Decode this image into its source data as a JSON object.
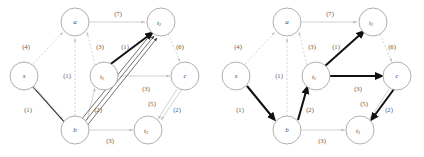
{
  "figure": {
    "type": "diagram",
    "kind": "directed-graph-pair",
    "panels": [
      {
        "id": "left",
        "nodes": [
          {
            "id": "a",
            "label": "a",
            "sub": "",
            "cx": 75,
            "cy": 22,
            "r": 14
          },
          {
            "id": "t2",
            "label": "t",
            "sub": "2",
            "cx": 161,
            "cy": 22,
            "r": 14
          },
          {
            "id": "s",
            "label": "s",
            "sub": "",
            "cx": 24,
            "cy": 76,
            "r": 14
          },
          {
            "id": "t1",
            "label": "t",
            "sub": "1",
            "cx": 104,
            "cy": 76,
            "r": 14
          },
          {
            "id": "c",
            "label": "c",
            "sub": "",
            "cx": 185,
            "cy": 76,
            "r": 14
          },
          {
            "id": "b",
            "label": "b",
            "sub": "",
            "cx": 75,
            "cy": 130,
            "r": 14
          },
          {
            "id": "t3",
            "label": "t",
            "sub": "3",
            "cx": 148,
            "cy": 130,
            "r": 14
          }
        ],
        "edges": [
          {
            "from": "s",
            "to": "a",
            "cost": "(4)",
            "style": "dash",
            "lx": 26,
            "ly": 47
          },
          {
            "from": "b",
            "to": "a",
            "cost": "(1)",
            "style": "dash",
            "lx": 67,
            "ly": 76
          },
          {
            "from": "t1",
            "to": "a",
            "cost": "(3)",
            "style": "dash",
            "lx": 100,
            "ly": 47
          },
          {
            "from": "a",
            "to": "t2",
            "cost": "(7)",
            "style": "light",
            "lx": 118,
            "ly": 14
          },
          {
            "from": "t1",
            "to": "t2",
            "cost": "(1)",
            "style": "bold",
            "lx": 125,
            "ly": 47
          },
          {
            "from": "t2",
            "to": "c",
            "cost": "(6)",
            "style": "dash",
            "lx": 180,
            "ly": 47
          },
          {
            "from": "t1",
            "to": "c",
            "cost": "(3)",
            "style": "light",
            "lx": 146,
            "ly": 89
          },
          {
            "from": "s",
            "to": "b",
            "cost": "(1)",
            "style": "light",
            "lx": 28,
            "ly": 110
          },
          {
            "from": "b",
            "to": "t1",
            "cost": "(2)",
            "style": "light",
            "lx": 98,
            "ly": 110
          },
          {
            "from": "b",
            "to": "t3",
            "cost": "(3)",
            "style": "light",
            "lx": 110,
            "ly": 141
          },
          {
            "from": "c",
            "to": "t3",
            "cost": "(5)",
            "style": "light",
            "lx": 152,
            "ly": 104
          },
          {
            "from": "c",
            "to": "t3",
            "cost": "(2)",
            "style": "light",
            "lx": 177,
            "ly": 110
          }
        ],
        "highlighted_paths": "s->b->t1->t2 (overlaid multi-line path)"
      },
      {
        "id": "right",
        "nodes": [
          {
            "id": "a",
            "label": "a",
            "sub": "",
            "cx": 75,
            "cy": 22,
            "r": 14
          },
          {
            "id": "t2",
            "label": "t",
            "sub": "2",
            "cx": 161,
            "cy": 22,
            "r": 14
          },
          {
            "id": "s",
            "label": "s",
            "sub": "",
            "cx": 24,
            "cy": 76,
            "r": 14
          },
          {
            "id": "t1",
            "label": "t",
            "sub": "1",
            "cx": 104,
            "cy": 76,
            "r": 14
          },
          {
            "id": "c",
            "label": "c",
            "sub": "",
            "cx": 185,
            "cy": 76,
            "r": 14
          },
          {
            "id": "b",
            "label": "b",
            "sub": "",
            "cx": 75,
            "cy": 130,
            "r": 14
          },
          {
            "id": "t3",
            "label": "t",
            "sub": "3",
            "cx": 148,
            "cy": 130,
            "r": 14
          }
        ],
        "edges": [
          {
            "from": "s",
            "to": "a",
            "cost": "(4)",
            "style": "dash",
            "lx": 26,
            "ly": 47
          },
          {
            "from": "b",
            "to": "a",
            "cost": "(1)",
            "style": "dash",
            "lx": 67,
            "ly": 76
          },
          {
            "from": "t1",
            "to": "a",
            "cost": "(3)",
            "style": "dash",
            "lx": 100,
            "ly": 47
          },
          {
            "from": "a",
            "to": "t2",
            "cost": "(7)",
            "style": "light",
            "lx": 118,
            "ly": 14
          },
          {
            "from": "t1",
            "to": "t2",
            "cost": "(1)",
            "style": "bold",
            "lx": 124,
            "ly": 47
          },
          {
            "from": "t2",
            "to": "c",
            "cost": "(6)",
            "style": "dash",
            "lx": 180,
            "ly": 47
          },
          {
            "from": "t1",
            "to": "c",
            "cost": "(3)",
            "style": "bold",
            "lx": 146,
            "ly": 89
          },
          {
            "from": "s",
            "to": "b",
            "cost": "(1)",
            "style": "bold",
            "lx": 28,
            "ly": 110
          },
          {
            "from": "b",
            "to": "t1",
            "cost": "(2)",
            "style": "bold",
            "lx": 98,
            "ly": 110
          },
          {
            "from": "b",
            "to": "t3",
            "cost": "(3)",
            "style": "light",
            "lx": 110,
            "ly": 141
          },
          {
            "from": "c",
            "to": "t3",
            "cost": "(5)",
            "style": "light",
            "lx": 152,
            "ly": 104
          },
          {
            "from": "c",
            "to": "t3",
            "cost": "(2)",
            "style": "bold",
            "lx": 177,
            "ly": 110
          }
        ],
        "highlighted_paths": "s->b->t1->t2 and t1->c->t3 (bold arrows)"
      }
    ]
  }
}
